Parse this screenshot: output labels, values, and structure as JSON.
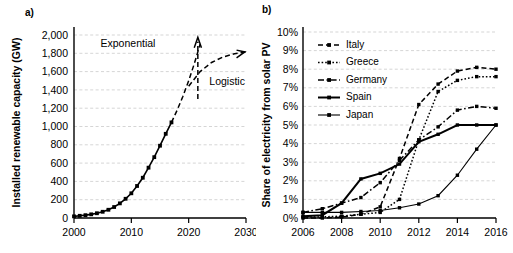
{
  "figure": {
    "panel_a_label": "a)",
    "panel_b_label": "b)"
  },
  "chart_data": [
    {
      "id": "panel-a",
      "type": "line",
      "title": "",
      "xlabel": "",
      "ylabel": "Installed renewable capacity (GW)",
      "xlim": [
        2000,
        2030
      ],
      "ylim": [
        0,
        2000
      ],
      "xticks": [
        2000,
        2010,
        2020,
        2030
      ],
      "xticklabels": [
        "2000",
        "2010",
        "2020",
        "2030"
      ],
      "yticks": [
        0,
        200,
        400,
        600,
        800,
        1000,
        1200,
        1400,
        1600,
        1800,
        2000
      ],
      "yticklabels": [
        "0",
        "200",
        "400",
        "600",
        "800",
        "1,000",
        "1,200",
        "1,400",
        "1,600",
        "1,800",
        "2,000"
      ],
      "grid": true,
      "legend": "none",
      "series": [
        {
          "name": "Installed renewable capacity",
          "style": "solid-with-markers",
          "x": [
            2000,
            2001,
            2002,
            2003,
            2004,
            2005,
            2006,
            2007,
            2008,
            2009,
            2010,
            2011,
            2012,
            2013,
            2014,
            2015,
            2016,
            2017
          ],
          "values": [
            18,
            24,
            31,
            40,
            52,
            68,
            90,
            120,
            160,
            210,
            270,
            350,
            440,
            550,
            665,
            790,
            920,
            1045
          ]
        },
        {
          "name": "Exponential projection",
          "style": "dashed",
          "x": [
            2017,
            2018,
            2019,
            2020,
            2021,
            2022
          ],
          "values": [
            1045,
            1180,
            1330,
            1500,
            1690,
            1900
          ]
        },
        {
          "name": "Logistic projection",
          "style": "dashed",
          "x": [
            2020,
            2022,
            2024,
            2026,
            2028,
            2030
          ],
          "values": [
            1440,
            1600,
            1700,
            1760,
            1795,
            1815
          ]
        }
      ],
      "annotations": [
        {
          "text": "Exponential",
          "x": 2014.2,
          "y": 1870
        },
        {
          "text": "Logistic",
          "x": 2023.6,
          "y": 1450
        }
      ]
    },
    {
      "id": "panel-b",
      "type": "line",
      "title": "",
      "xlabel": "",
      "ylabel": "Share of electricity from solar PV",
      "xlim": [
        2006,
        2016
      ],
      "ylim": [
        0,
        10
      ],
      "xticks": [
        2006,
        2008,
        2010,
        2012,
        2014,
        2016
      ],
      "xticklabels": [
        "2006",
        "2008",
        "2010",
        "2012",
        "2014",
        "2016"
      ],
      "yticks": [
        0,
        1,
        2,
        3,
        4,
        5,
        6,
        7,
        8,
        9,
        10
      ],
      "yticklabels": [
        "0%",
        "1%",
        "2%",
        "3%",
        "4%",
        "5%",
        "6%",
        "7%",
        "8%",
        "9%",
        "10%"
      ],
      "grid": true,
      "legend": "upper-left",
      "x": [
        2006,
        2007,
        2008,
        2009,
        2010,
        2011,
        2012,
        2013,
        2014,
        2015,
        2016
      ],
      "series": [
        {
          "name": "Italy",
          "style": "dashed",
          "values": [
            0.0,
            0.0,
            0.05,
            0.2,
            0.6,
            3.2,
            6.1,
            7.2,
            7.9,
            8.1,
            8.0
          ]
        },
        {
          "name": "Greece",
          "style": "dotted",
          "values": [
            0.05,
            0.06,
            0.1,
            0.2,
            0.3,
            1.0,
            4.2,
            6.8,
            7.4,
            7.6,
            7.6
          ]
        },
        {
          "name": "Germany",
          "style": "dash-dot",
          "values": [
            0.3,
            0.5,
            0.8,
            1.1,
            1.9,
            3.1,
            4.2,
            4.9,
            5.8,
            6.0,
            5.9
          ]
        },
        {
          "name": "Spain",
          "style": "solid-thick",
          "values": [
            0.1,
            0.15,
            0.8,
            2.1,
            2.4,
            2.9,
            4.1,
            4.5,
            5.0,
            5.0,
            5.0
          ]
        },
        {
          "name": "Japan",
          "style": "solid-thin",
          "values": [
            0.3,
            0.3,
            0.3,
            0.35,
            0.4,
            0.55,
            0.75,
            1.2,
            2.3,
            3.7,
            5.0
          ]
        }
      ]
    }
  ]
}
